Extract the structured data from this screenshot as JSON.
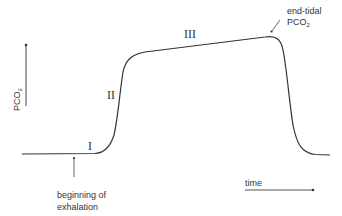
{
  "diagram": {
    "y_axis_label": "PCO",
    "y_axis_label_sub": "2",
    "x_axis_label": "time",
    "phases": [
      {
        "id": "phase-1",
        "label": "I"
      },
      {
        "id": "phase-2",
        "label": "II"
      },
      {
        "id": "phase-3",
        "label": "III"
      }
    ],
    "annotations": {
      "end_tidal_line1": "end-tidal",
      "end_tidal_line2": "PCO",
      "end_tidal_sub": "2",
      "beginning_line1": "beginning of",
      "beginning_line2": "exhalation"
    },
    "colors": {
      "line": "#333333"
    }
  }
}
